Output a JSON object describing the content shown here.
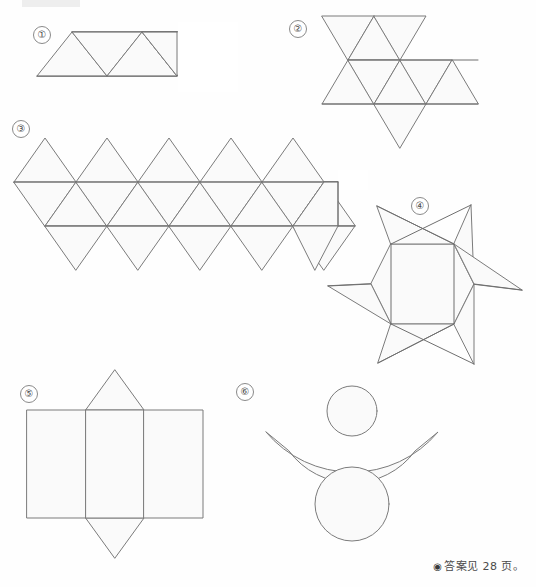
{
  "page": {
    "width": 536,
    "height": 587,
    "background_color": "#fefefe",
    "shape_fill_color": "#fafafa",
    "shape_stroke_color": "#7b7b7b",
    "label_text_color": "#4b4b4b"
  },
  "footnote": {
    "bullet": "◉",
    "text": "答案见 28 页。"
  },
  "figures": [
    {
      "id": "fig-1",
      "label": "①",
      "caption": "",
      "kind": "triangle-strip-net",
      "description": "Strip of four equilateral triangles alternating up and down, forming a parallelogram (tetrahedron net)",
      "triangle_count": 4,
      "label_position": {
        "x": 33,
        "y": 26
      }
    },
    {
      "id": "fig-2",
      "label": "②",
      "caption": "",
      "kind": "octahedron-net",
      "description": "Eight equilateral triangles arranged in a staggered band (octahedron net)",
      "triangle_count": 8,
      "label_position": {
        "x": 289,
        "y": 20
      }
    },
    {
      "id": "fig-3",
      "label": "③",
      "caption": "",
      "kind": "icosahedron-net",
      "description": "Twenty equilateral triangles: top row of five, two alternating middle strips, bottom row of five (icosahedron net)",
      "triangle_count": 20,
      "label_position": {
        "x": 12,
        "y": 120
      }
    },
    {
      "id": "fig-4",
      "label": "④",
      "caption": "",
      "kind": "six-point-star-net",
      "description": "Six-pointed star with a hexagonal centre and six skewed triangular flaps whose edges cross",
      "point_count": 6,
      "label_position": {
        "x": 411,
        "y": 197
      }
    },
    {
      "id": "fig-5",
      "label": "⑤",
      "caption": "",
      "kind": "prism-net",
      "description": "Rectangle divided into three vertical panels with an upward triangle above and a downward triangle below the middle panel",
      "panel_count": 3,
      "triangle_count": 2,
      "label_position": {
        "x": 20,
        "y": 385
      }
    },
    {
      "id": "fig-6",
      "label": "⑥",
      "caption": "",
      "kind": "cone-frustum-net",
      "description": "Annular sector (curved band) with a small circle tangent above and a large circle below",
      "circle_count": 2,
      "label_position": {
        "x": 236,
        "y": 383
      }
    }
  ]
}
